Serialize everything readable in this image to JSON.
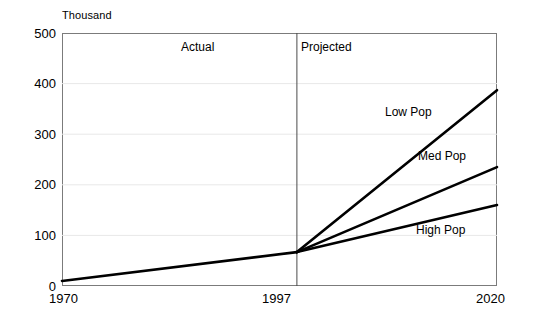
{
  "chart_data": {
    "type": "line",
    "title": "",
    "subtitle": "",
    "unit_label": "Thousand",
    "xlabel": "",
    "ylabel": "",
    "xlim": [
      1970,
      2020
    ],
    "ylim": [
      0,
      500
    ],
    "yticks": [
      0,
      100,
      200,
      300,
      400,
      500
    ],
    "ytick_labels": [
      "0",
      "100",
      "200",
      "300",
      "400",
      "500"
    ],
    "xticks": [
      1970,
      1997,
      2020
    ],
    "xtick_labels": [
      "1970",
      "1997",
      "2020"
    ],
    "grid": "horizontal",
    "legend_position": "inline-right",
    "divider_year": 1997,
    "annotations": [
      {
        "name": "actual-period",
        "text": "Actual",
        "x": 1983,
        "y": 470
      },
      {
        "name": "projected-period",
        "text": "Projected",
        "x": 2003,
        "y": 470
      }
    ],
    "series": [
      {
        "name": "Actual",
        "label": "",
        "style": "solid",
        "color": "#000000",
        "x": [
          1970,
          1997
        ],
        "values": [
          10,
          67
        ]
      },
      {
        "name": "Low Pop",
        "label": "Low Pop",
        "style": "solid",
        "color": "#000000",
        "x": [
          1997,
          2020
        ],
        "values": [
          67,
          387
        ]
      },
      {
        "name": "Med Pop",
        "label": "Med Pop",
        "style": "solid",
        "color": "#000000",
        "x": [
          1997,
          2020
        ],
        "values": [
          67,
          235
        ]
      },
      {
        "name": "High Pop",
        "label": "High Pop",
        "style": "solid",
        "color": "#000000",
        "x": [
          1997,
          2020
        ],
        "values": [
          67,
          160
        ]
      }
    ]
  },
  "axis": {
    "y_ticks": [
      {
        "label": "500"
      },
      {
        "label": "400"
      },
      {
        "label": "300"
      },
      {
        "label": "200"
      },
      {
        "label": "100"
      },
      {
        "label": "0"
      }
    ],
    "x_ticks": [
      {
        "label": "1970"
      },
      {
        "label": "1997"
      },
      {
        "label": "2020"
      }
    ]
  },
  "colors": {
    "series_line": "#000000",
    "frame": "#7b7b7b",
    "gridline": "#e8e8e8",
    "divider": "#4a4a4a",
    "background": "#ffffff",
    "text": "#000000"
  }
}
